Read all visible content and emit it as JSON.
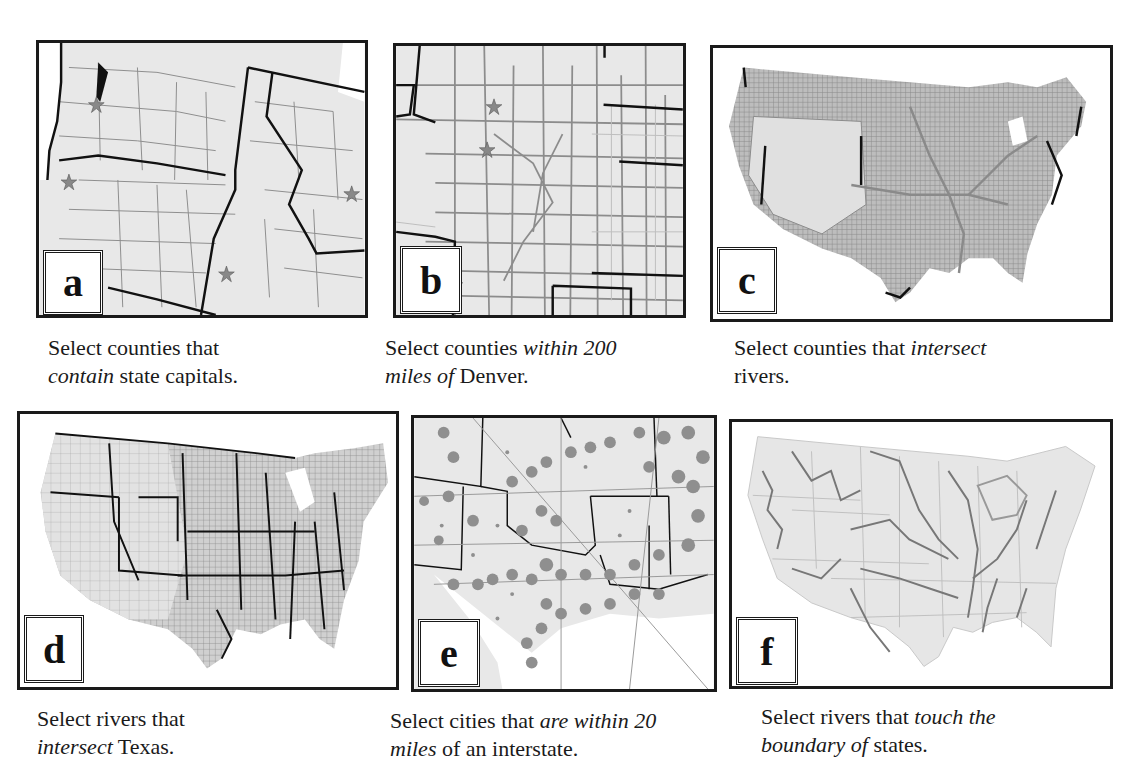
{
  "figure": {
    "panels": [
      {
        "id": "a",
        "label": "a",
        "map": "Pacific Northwest counties with state capital stars",
        "caption": {
          "pre": "Select counties that",
          "em": "contain",
          "post": " state capitals."
        }
      },
      {
        "id": "b",
        "label": "b",
        "map": "Colorado region counties with city stars",
        "caption": {
          "pre": "Select counties ",
          "em": "within 200",
          "line2_em": "miles of",
          "post": " Denver."
        }
      },
      {
        "id": "c",
        "label": "c",
        "map": "US counties with river-intersecting counties highlighted",
        "caption": {
          "pre": "Select counties that ",
          "em": "intersect",
          "post": "rivers."
        }
      },
      {
        "id": "d",
        "label": "d",
        "map": "US states and counties with rivers",
        "caption": {
          "pre": "Select rivers that",
          "em": "intersect",
          "post": " Texas."
        }
      },
      {
        "id": "e",
        "label": "e",
        "map": "South-central US cities near interstates",
        "caption": {
          "pre": "Select cities that ",
          "em": "are within 20",
          "line2_em": "miles",
          "post": " of an interstate."
        }
      },
      {
        "id": "f",
        "label": "f",
        "map": "US rivers and state boundaries",
        "caption": {
          "pre": "Select rivers that ",
          "em": "touch the",
          "line2_em": "boundary of",
          "post": " states."
        }
      }
    ],
    "colors": {
      "map_fill": "#e6e6e6",
      "county_line": "#8c8c8c",
      "state_line": "#111111",
      "highlight": "#8a8a8a",
      "frame": "#1a1a1a"
    }
  }
}
